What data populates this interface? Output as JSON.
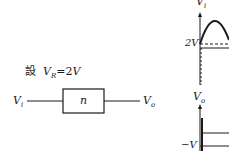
{
  "given": {
    "prefix": "設",
    "var": "V",
    "sub": "R",
    "eq": "=2",
    "unit": "V"
  },
  "circuit": {
    "input_label": "V",
    "input_sub": "i",
    "block_label": "n",
    "output_label": "V",
    "output_sub": "o"
  },
  "graph_top": {
    "axis_label": "V",
    "axis_sub": "i",
    "level_label": "2V"
  },
  "graph_bottom": {
    "axis_label": "V",
    "axis_sub": "o",
    "level_label": "−V"
  }
}
